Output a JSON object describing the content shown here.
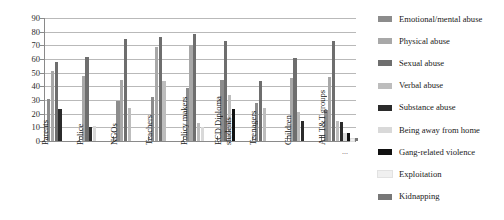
{
  "chart_data": {
    "type": "bar",
    "title": "",
    "xlabel": "",
    "ylabel": "",
    "ylim": [
      0,
      90
    ],
    "yticks": [
      90,
      80,
      70,
      60,
      50,
      40,
      30,
      20,
      10,
      0
    ],
    "grid": true,
    "legend_position": "right",
    "categories": [
      "Parents",
      "Police",
      "NGOs",
      "Teachers",
      "Policy makers",
      "ECD Diploma students",
      "Teenagers",
      "Children",
      "All T&T groups"
    ],
    "series": [
      {
        "name": "Emotional/mental abuse",
        "color": "#8c8c8c",
        "values": [
          31,
          0,
          29.5,
          32,
          38.5,
          45,
          28,
          0,
          23
        ]
      },
      {
        "name": "Physical abuse",
        "color": "#a8a8a8",
        "values": [
          51,
          47.5,
          44.5,
          68.5,
          70,
          0,
          0,
          46,
          47
        ]
      },
      {
        "name": "Sexual abuse",
        "color": "#6e6e6e",
        "values": [
          58,
          61.5,
          75,
          76,
          78.5,
          73.5,
          44,
          61,
          73.5
        ]
      },
      {
        "name": "Verbal abuse",
        "color": "#bdbdbd",
        "values": [
          0,
          0,
          24.5,
          44,
          13,
          34,
          24,
          21,
          14.5
        ]
      },
      {
        "name": "Substance abuse",
        "color": "#2b2b2b",
        "values": [
          23.5,
          10,
          0,
          0,
          0,
          0,
          0,
          15,
          14
        ]
      },
      {
        "name": "Being away from home",
        "color": "#d9d9d9",
        "values": [
          0,
          11,
          0,
          0,
          10.5,
          0,
          0,
          0,
          5.5
        ]
      },
      {
        "name": "Gang-related violence",
        "color": "#111111",
        "values": [
          0,
          0,
          0,
          0,
          0,
          23.5,
          0,
          0,
          5.5
        ]
      },
      {
        "name": "Exploitation",
        "color": "#f0f0f0",
        "values": [
          0,
          0,
          0,
          0,
          0,
          0,
          0,
          0,
          1.5
        ]
      },
      {
        "name": "Kidnapping",
        "color": "#777777",
        "values": [
          0,
          0,
          0,
          0,
          0,
          0,
          0,
          0,
          2
        ]
      }
    ]
  },
  "legend": {
    "items": [
      "Emotional/mental abuse",
      "Physical abuse",
      "Sexual abuse",
      "Verbal abuse",
      "Substance abuse",
      "Being away from home",
      "Gang-related violence",
      "Exploitation",
      "Kidnapping"
    ]
  },
  "axis": {
    "ellipsis_marker": "..."
  }
}
